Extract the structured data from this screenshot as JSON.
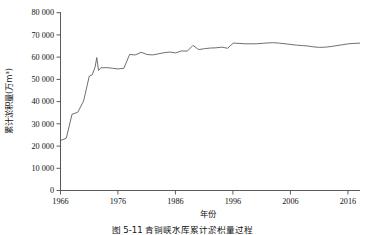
{
  "figure": {
    "caption_number": "图 5-11",
    "caption_title": "青铜峡水库累计淤积量过程",
    "caption_full": "图 5-11  青铜峡水库累计淤积量过程"
  },
  "chart_data": {
    "type": "line",
    "title": "",
    "xlabel": "年份",
    "ylabel": "累计淤积量(万m³)",
    "xlim": [
      1966,
      2018
    ],
    "ylim": [
      0,
      80000
    ],
    "xticks": [
      1966,
      1976,
      1986,
      1996,
      2006,
      2016
    ],
    "xtick_labels": [
      "1966",
      "1976",
      "1986",
      "1996",
      "2006",
      "2016"
    ],
    "yticks": [
      0,
      10000,
      20000,
      30000,
      40000,
      50000,
      60000,
      70000,
      80000
    ],
    "ytick_labels": [
      "0",
      "10 000",
      "20 000",
      "30 000",
      "40 000",
      "50 000",
      "60 000",
      "70 000",
      "80 000"
    ],
    "grid": false,
    "legend": "none",
    "line_color": "#555555",
    "series": [
      {
        "name": "累计淤积量",
        "x": [
          1966,
          1966,
          1967,
          1968,
          1969,
          1970,
          1971,
          1971.5,
          1972,
          1972.3,
          1972.6,
          1973,
          1974,
          1975,
          1976,
          1977,
          1978,
          1979,
          1980,
          1981,
          1982,
          1983,
          1984,
          1985,
          1986,
          1987,
          1988,
          1989,
          1990,
          1991,
          1992,
          1993,
          1994,
          1995,
          1996,
          1997,
          1998,
          1999,
          2000,
          2001,
          2002,
          2003,
          2004,
          2005,
          2006,
          2007,
          2008,
          2009,
          2010,
          2011,
          2012,
          2013,
          2014,
          2015,
          2016,
          2017,
          2018
        ],
        "y": [
          0,
          22500,
          23500,
          34300,
          35200,
          40200,
          51500,
          52000,
          55500,
          59800,
          54000,
          55200,
          55300,
          55000,
          54700,
          55000,
          61200,
          61000,
          62200,
          61200,
          61000,
          61500,
          62000,
          62300,
          61900,
          62800,
          62700,
          65300,
          63400,
          63800,
          64100,
          64200,
          64500,
          64000,
          66300,
          66200,
          66000,
          66000,
          66000,
          66200,
          66400,
          66500,
          66300,
          66000,
          65700,
          65400,
          65200,
          65000,
          64600,
          64400,
          64500,
          64800,
          65200,
          65600,
          66000,
          66200,
          66300
        ]
      }
    ]
  },
  "axes": {
    "y_axis_name": "y-axis",
    "x_axis_name": "x-axis"
  }
}
